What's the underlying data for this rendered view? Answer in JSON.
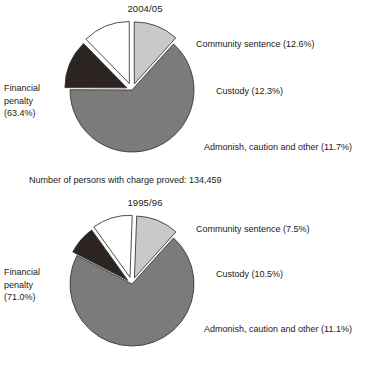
{
  "figure": {
    "background_color": "#ffffff",
    "caption": "Number of persons with charge proved: 134,459"
  },
  "palette": {
    "financial_penalty": "#7b7b7b",
    "community_sentence": "#2b2420",
    "custody": "#ffffff",
    "admonish": "#c9c9c9",
    "outline": "#3a3a3a"
  },
  "chart_data": [
    {
      "type": "pie",
      "title": "2004/05",
      "categories": [
        "Financial penalty",
        "Community sentence",
        "Custody",
        "Admonish, caution and other"
      ],
      "values": [
        63.4,
        12.6,
        12.3,
        11.7
      ],
      "unit": "%",
      "labels": [
        "Financial\npenalty\n(63.4%)",
        "Community sentence (12.6%)",
        "Custody (12.3%)",
        "Admonish, caution and other (11.7%)"
      ],
      "label_financial": "Financial penalty (63.4%)",
      "label_financial_l1": "Financial",
      "label_financial_l2": "penalty",
      "label_financial_l3": "(63.4%)",
      "label_community": "Community sentence (12.6%)",
      "label_custody": "Custody (12.3%)",
      "label_admonish": "Admonish, caution and other (11.7%)",
      "legend_position": "callout-labels",
      "exploded": true,
      "total_label": "Number of persons with charge proved: 134,459",
      "total_value": "134,459"
    },
    {
      "type": "pie",
      "title": "1995/96",
      "categories": [
        "Financial penalty",
        "Community sentence",
        "Custody",
        "Admonish, caution and other"
      ],
      "values": [
        71.0,
        7.5,
        10.5,
        11.1
      ],
      "unit": "%",
      "labels": [
        "Financial\npenalty\n(71.0%)",
        "Community sentence (7.5%)",
        "Custody (10.5%)",
        "Admonish, caution and other (11.1%)"
      ],
      "label_financial": "Financial penalty (71.0%)",
      "label_financial_l1": "Financial",
      "label_financial_l2": "penalty",
      "label_financial_l3": "(71.0%)",
      "label_community": "Community sentence (7.5%)",
      "label_custody": "Custody (10.5%)",
      "label_admonish": "Admonish, caution and other (11.1%)",
      "legend_position": "callout-labels",
      "exploded": true
    }
  ]
}
